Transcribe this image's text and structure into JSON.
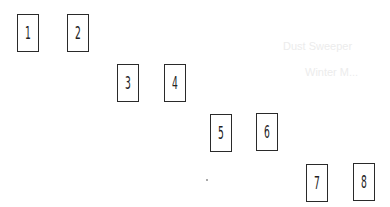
{
  "bleed_through": [
    {
      "text": "Dust Sweeper",
      "x": 283,
      "y": 40
    },
    {
      "text": "Winter M...",
      "x": 305,
      "y": 66
    }
  ],
  "cards": [
    {
      "label": "1",
      "x": 17,
      "y": 14
    },
    {
      "label": "2",
      "x": 67,
      "y": 14
    },
    {
      "label": "3",
      "x": 117,
      "y": 64
    },
    {
      "label": "4",
      "x": 164,
      "y": 64
    },
    {
      "label": "5",
      "x": 210,
      "y": 114
    },
    {
      "label": "6",
      "x": 256,
      "y": 113
    },
    {
      "label": "7",
      "x": 306,
      "y": 164
    },
    {
      "label": "8",
      "x": 353,
      "y": 163
    }
  ]
}
